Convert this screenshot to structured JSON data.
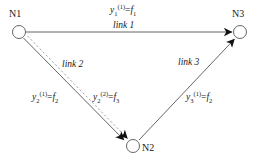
{
  "diagram": {
    "type": "network-node-link-diagram",
    "background_color": "#ffffff",
    "stroke_color": "#555555",
    "text_color": "#1a1a1a",
    "nodes": [
      {
        "id": "N1",
        "label": "N1",
        "cx": 19,
        "cy": 32,
        "r": 6.5
      },
      {
        "id": "N2",
        "label": "N2",
        "cx": 133,
        "cy": 146,
        "r": 6.5
      },
      {
        "id": "N3",
        "label": "N3",
        "cx": 240,
        "cy": 32,
        "r": 6.5
      }
    ],
    "links": [
      {
        "id": "link1",
        "label": "link 1",
        "from": "N1",
        "to": "N3",
        "style": "solid",
        "arrow": true,
        "flow_label": {
          "var": "y",
          "sub": "1",
          "sup": "(1)",
          "eq": "=",
          "rhs_var": "f",
          "rhs_sub": "1"
        }
      },
      {
        "id": "link2",
        "label": "link 2",
        "from": "N1",
        "to": "N2",
        "style": "solid-and-dashed",
        "arrow": true,
        "flow_label_1": {
          "var": "y",
          "sub": "2",
          "sup": "(1)",
          "eq": "=",
          "rhs_var": "f",
          "rhs_sub": "2"
        },
        "flow_label_2": {
          "var": "y",
          "sub": "2",
          "sup": "(2)",
          "eq": "=",
          "rhs_var": "f",
          "rhs_sub": "3"
        }
      },
      {
        "id": "link3",
        "label": "link 3",
        "from": "N2",
        "to": "N3",
        "style": "solid",
        "arrow": true,
        "flow_label": {
          "var": "y",
          "sub": "3",
          "sup": "(1)",
          "eq": "=",
          "rhs_var": "f",
          "rhs_sub": "2"
        }
      }
    ],
    "labels": {
      "node_n1": "N1",
      "node_n2": "N2",
      "node_n3": "N3",
      "link1": "link 1",
      "link2": "link 2",
      "link3": "link 3",
      "y1_var": "y",
      "y1_sub": "1",
      "y1_sup": "(1)",
      "y1_eq": "=",
      "y1_rhs": "f",
      "y1_rhs_sub": "1",
      "y2a_var": "y",
      "y2a_sub": "2",
      "y2a_sup": "(1)",
      "y2a_eq": "=",
      "y2a_rhs": "f",
      "y2a_rhs_sub": "2",
      "y2b_var": "y",
      "y2b_sub": "2",
      "y2b_sup": "(2)",
      "y2b_eq": "=",
      "y2b_rhs": "f",
      "y2b_rhs_sub": "3",
      "y3_var": "y",
      "y3_sub": "3",
      "y3_sup": "(1)",
      "y3_eq": "=",
      "y3_rhs": "f",
      "y3_rhs_sub": "2"
    }
  }
}
